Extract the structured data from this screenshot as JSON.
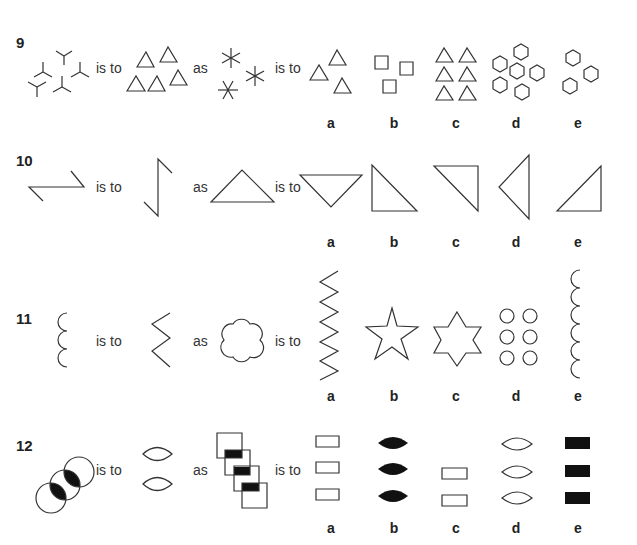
{
  "questions": [
    {
      "number": "9",
      "connectors": {
        "is_to_1": "is to",
        "as": "as",
        "is_to_2": "is to"
      },
      "stem": [
        "5 three-pronged Y shapes",
        "5 triangles",
        "3 six-pointed asterisks"
      ],
      "options": [
        {
          "label": "a",
          "description": "3 triangles"
        },
        {
          "label": "b",
          "description": "3 squares"
        },
        {
          "label": "c",
          "description": "6 triangles"
        },
        {
          "label": "d",
          "description": "7 hexagons"
        },
        {
          "label": "e",
          "description": "3 hexagons"
        }
      ]
    },
    {
      "number": "10",
      "connectors": {
        "is_to_1": "is to",
        "as": "as",
        "is_to_2": "is to"
      },
      "stem": [
        "horizontal Z shape",
        "vertical N shape",
        "upward triangle"
      ],
      "options": [
        {
          "label": "a",
          "description": "inverted triangle"
        },
        {
          "label": "b",
          "description": "right triangle, right angle bottom-left"
        },
        {
          "label": "c",
          "description": "right triangle, right angle top-right"
        },
        {
          "label": "d",
          "description": "triangle pointing left"
        },
        {
          "label": "e",
          "description": "right triangle, right angle bottom-right"
        }
      ]
    },
    {
      "number": "11",
      "connectors": {
        "is_to_1": "is to",
        "as": "as",
        "is_to_2": "is to"
      },
      "stem": [
        "3 stacked arcs",
        "3-point zigzag",
        "6-lobed flower"
      ],
      "options": [
        {
          "label": "a",
          "description": "long zigzag"
        },
        {
          "label": "b",
          "description": "5-pointed star"
        },
        {
          "label": "c",
          "description": "6-pointed star"
        },
        {
          "label": "d",
          "description": "6 circles"
        },
        {
          "label": "e",
          "description": "6 stacked arcs"
        }
      ]
    },
    {
      "number": "12",
      "connectors": {
        "is_to_1": "is to",
        "as": "as",
        "is_to_2": "is to"
      },
      "stem": [
        "3 overlapping circles with black lens overlaps",
        "2 lens shapes",
        "4 overlapping squares with black overlaps"
      ],
      "options": [
        {
          "label": "a",
          "description": "3 outlined rectangles"
        },
        {
          "label": "b",
          "description": "3 black lenses"
        },
        {
          "label": "c",
          "description": "2 outlined rectangles"
        },
        {
          "label": "d",
          "description": "3 outlined lenses"
        },
        {
          "label": "e",
          "description": "3 black rectangles"
        }
      ]
    }
  ]
}
